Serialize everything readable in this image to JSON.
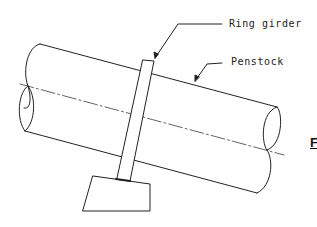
{
  "diagram": {
    "labels": {
      "ring_girder": "Ring girder",
      "penstock": "Penstock",
      "figure_fragment": "F"
    },
    "components": [
      "penstock-pipe",
      "centerline",
      "ring-girder",
      "support-pier"
    ],
    "colors": {
      "line": "#222222",
      "background": "#ffffff"
    }
  }
}
